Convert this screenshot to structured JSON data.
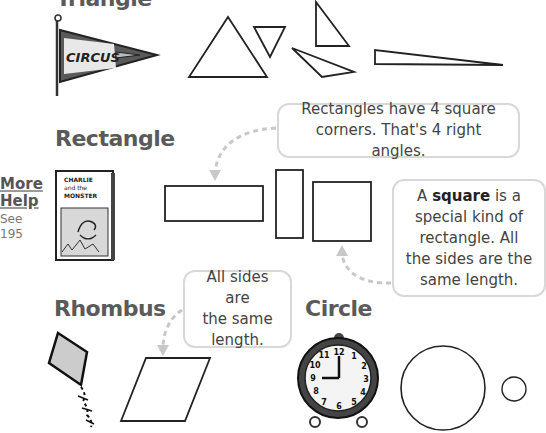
{
  "sections": {
    "triangle": {
      "heading": "Triangle"
    },
    "rectangle": {
      "heading": "Rectangle"
    },
    "rhombus": {
      "heading": "Rhombus"
    },
    "circle": {
      "heading": "Circle"
    }
  },
  "more_help": {
    "title_line1": "More",
    "title_line2": "Help",
    "see_label": "See",
    "page": "195"
  },
  "callouts": {
    "rectangle": {
      "line1": "Rectangles have 4 square",
      "line2": "corners. That's 4 right angles."
    },
    "square": {
      "prefix": "A ",
      "bold": "square",
      "suffix_line1": " is a",
      "line2": "special kind of",
      "line3": "rectangle. All",
      "line4": "the sides are the",
      "line5": "same length."
    },
    "rhombus": {
      "line1": "All sides are",
      "line2": "the same",
      "line3": "length."
    }
  },
  "illustrations": {
    "pennant_text": "CIRCUS",
    "book_title_line1": "CHARLIE",
    "book_title_line2": "and the",
    "book_title_line3": "MONSTER",
    "clock_numbers": [
      "12",
      "1",
      "2",
      "3",
      "4",
      "5",
      "6",
      "7",
      "8",
      "9",
      "10",
      "11"
    ],
    "clock_time": "9:00"
  },
  "colors": {
    "heading": "#5a5a5a",
    "callout_border": "#d8d8d8",
    "arrow": "#c8c8c8",
    "shape_stroke": "#222222",
    "pennant_fill": "#555555",
    "kite_fill": "#cccccc"
  }
}
